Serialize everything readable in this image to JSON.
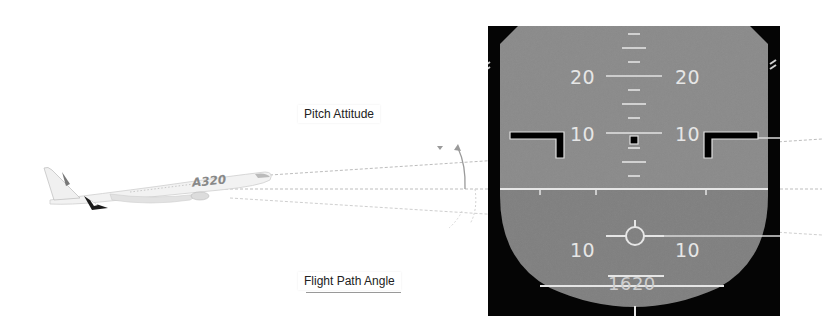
{
  "diagram": {
    "labels": {
      "pitch_attitude": "Pitch Attitude",
      "flight_path_angle": "Flight Path Angle"
    },
    "aircraft": {
      "type_marking": "A320",
      "icon": "airplane-icon"
    },
    "pfd": {
      "pitch_scale_upper": {
        "left": "20",
        "right": "20"
      },
      "pitch_scale_mid": {
        "left": "10",
        "right": "10"
      },
      "pitch_scale_lower": {
        "left": "10",
        "right": "10"
      },
      "altitude_readout": "1620",
      "colors": {
        "sky": "#8a8a8a",
        "ground": "#7e7e7e",
        "bezel": "#050505",
        "markings": "#e8e8e8"
      }
    }
  }
}
